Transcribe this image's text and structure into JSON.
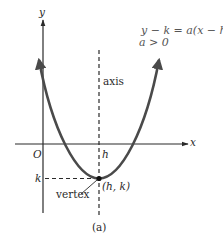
{
  "figure": {
    "caption": "(a)",
    "equation_line1": "y − k = a(x − h)",
    "equation_exponent": "2",
    "equation_comma": ",",
    "equation_line2": "a > 0"
  },
  "axes": {
    "x_label": "x",
    "y_label": "y",
    "origin_label": "O",
    "h_label": "h",
    "k_label": "k"
  },
  "annotations": {
    "axis_label": "axis",
    "vertex_label": "vertex",
    "vertex_point_label": "(h, k)"
  },
  "colors": {
    "curve": "#4a4a4a",
    "axes": "#2a2a2a",
    "dashed": "#2a2a2a",
    "text": "#2a2a2a"
  }
}
